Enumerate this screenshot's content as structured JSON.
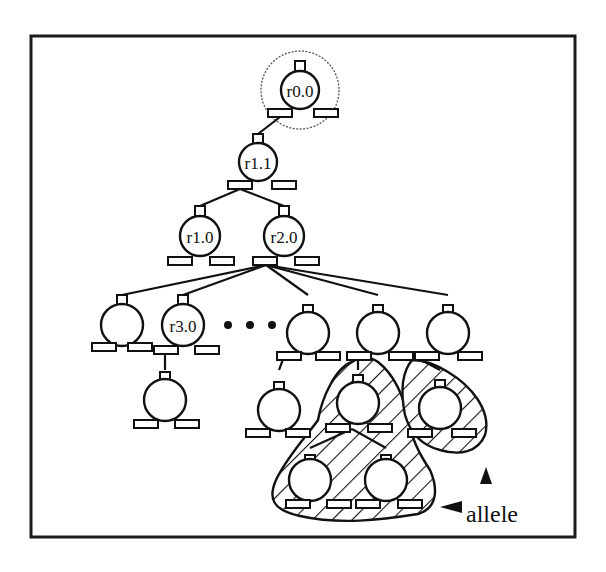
{
  "diagram": {
    "type": "tree",
    "colors": {
      "stroke": "#111111",
      "background": "#ffffff"
    },
    "nodes": [
      {
        "id": "n00",
        "label": "r0.0",
        "highlighted": true
      },
      {
        "id": "n11",
        "label": "r1.1",
        "parent": "n00"
      },
      {
        "id": "n10",
        "label": "r1.0",
        "parent": "n11"
      },
      {
        "id": "n20",
        "label": "r2.0",
        "parent": "n11"
      },
      {
        "id": "c1",
        "label": "",
        "parent": "n20"
      },
      {
        "id": "n30",
        "label": "r3.0",
        "parent": "n20"
      },
      {
        "id": "c3",
        "label": "",
        "parent": "n20"
      },
      {
        "id": "c4",
        "label": "",
        "parent": "n20"
      },
      {
        "id": "c5",
        "label": "",
        "parent": "n20"
      },
      {
        "id": "g1",
        "label": "",
        "parent": "n30"
      },
      {
        "id": "g2",
        "label": "",
        "parent": "c3"
      },
      {
        "id": "g3",
        "label": "",
        "parent": "c4",
        "allele": "A"
      },
      {
        "id": "g4",
        "label": "",
        "parent": "c4",
        "allele": "B"
      },
      {
        "id": "h1",
        "label": "",
        "parent": "g3",
        "allele": "A"
      },
      {
        "id": "h2",
        "label": "",
        "parent": "g3",
        "allele": "A"
      }
    ],
    "ellipsis": "• • •",
    "annotation": {
      "label": "allele",
      "arrows": [
        "left",
        "up"
      ]
    }
  }
}
